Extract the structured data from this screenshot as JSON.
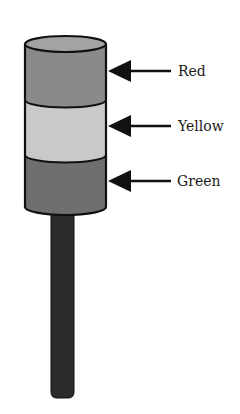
{
  "diagram": {
    "type": "stack-light-tower",
    "colors": {
      "background": "#ffffff",
      "outline": "#111111",
      "top_cap": "#a3a3a3",
      "red_band": "#8a8a8a",
      "yellow_band": "#c9c9c9",
      "green_band": "#6f6f6f",
      "pole": "#2b2b2b",
      "arrow": "#111111",
      "label_text": "#1a1a1a"
    },
    "bands": [
      {
        "id": "red",
        "label": "Red"
      },
      {
        "id": "yellow",
        "label": "Yellow"
      },
      {
        "id": "green",
        "label": "Green"
      }
    ]
  }
}
